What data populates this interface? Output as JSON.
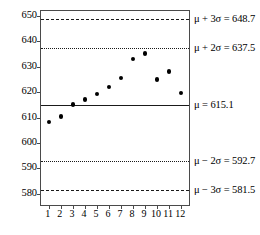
{
  "chart_data": {
    "type": "scatter",
    "title": "",
    "subtitle": "",
    "xlabel": "",
    "ylabel": "",
    "x": [
      1,
      2,
      3,
      4,
      5,
      6,
      7,
      8,
      9,
      10,
      11,
      12
    ],
    "categories": [
      "1",
      "2",
      "3",
      "4",
      "5",
      "6",
      "7",
      "8",
      "9",
      "10",
      "11",
      "12"
    ],
    "values": [
      608.3,
      610.4,
      615.1,
      617.0,
      619.2,
      622.1,
      625.6,
      633.0,
      635.2,
      625.0,
      628.1,
      619.7
    ],
    "series": [
      {
        "name": "observation",
        "values": [
          608.3,
          610.4,
          615.1,
          617.0,
          619.2,
          622.1,
          625.6,
          633.0,
          635.2,
          625.0,
          628.1,
          619.7
        ]
      }
    ],
    "xlim": [
      0.35,
      12.65
    ],
    "ylim": [
      575.5,
      652.0
    ],
    "y_ticks": [
      580,
      590,
      600,
      610,
      620,
      630,
      640,
      650
    ],
    "y_tick_labels": [
      "580",
      "590",
      "600",
      "610",
      "620",
      "630",
      "640",
      "650"
    ],
    "x_ticks": [
      1,
      2,
      3,
      4,
      5,
      6,
      7,
      8,
      9,
      10,
      11,
      12
    ],
    "grid": false,
    "legend": "none",
    "marker": "filled-circle",
    "marker_color": "#000000",
    "control_lines": [
      {
        "id": "ucl3",
        "value": 648.7,
        "style": "dashed",
        "label": "μ + 3σ = 648.7",
        "label_math": "mu + 3 sigma = 648.7"
      },
      {
        "id": "ucl2",
        "value": 637.5,
        "style": "dotted",
        "label": "μ + 2σ = 637.5",
        "label_math": "mu + 2 sigma = 637.5"
      },
      {
        "id": "center",
        "value": 615.1,
        "style": "solid",
        "label": "μ = 615.1",
        "label_math": "mu = 615.1"
      },
      {
        "id": "lcl2",
        "value": 592.7,
        "style": "dotted",
        "label": "μ − 2σ = 592.7",
        "label_math": "mu - 2 sigma = 592.7"
      },
      {
        "id": "lcl3",
        "value": 581.5,
        "style": "dashed",
        "label": "μ − 3σ = 581.5",
        "label_math": "mu - 3 sigma = 581.5"
      }
    ],
    "colors": {
      "background": "#ffffff",
      "frame": "#4a4a4a",
      "line": "#1a1a1a",
      "marker": "#000000",
      "text": "#000000"
    }
  }
}
